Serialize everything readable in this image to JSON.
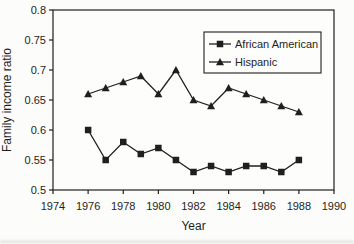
{
  "chart_data": {
    "type": "line",
    "title": "",
    "xlabel": "Year",
    "ylabel": "Family income ratio",
    "xlim": [
      1974,
      1990
    ],
    "ylim": [
      0.5,
      0.8
    ],
    "x_ticks": [
      1974,
      1976,
      1978,
      1980,
      1982,
      1984,
      1986,
      1988,
      1990
    ],
    "y_ticks": [
      0.5,
      0.55,
      0.6,
      0.65,
      0.7,
      0.75,
      0.8
    ],
    "grid": false,
    "legend": {
      "position": "inside-top-right",
      "border": true
    },
    "x": [
      1976,
      1977,
      1978,
      1979,
      1980,
      1981,
      1982,
      1983,
      1984,
      1985,
      1986,
      1987,
      1988
    ],
    "series": [
      {
        "name": "African American",
        "marker": "square",
        "values": [
          0.6,
          0.55,
          0.58,
          0.56,
          0.57,
          0.55,
          0.53,
          0.54,
          0.53,
          0.54,
          0.54,
          0.53,
          0.55
        ]
      },
      {
        "name": "Hispanic",
        "marker": "triangle",
        "values": [
          0.66,
          0.67,
          0.68,
          0.69,
          0.66,
          0.7,
          0.65,
          0.64,
          0.67,
          0.66,
          0.65,
          0.64,
          0.63
        ]
      }
    ],
    "colors": {
      "stroke": "#1f1f1f",
      "background": "#fdfdfc"
    }
  }
}
